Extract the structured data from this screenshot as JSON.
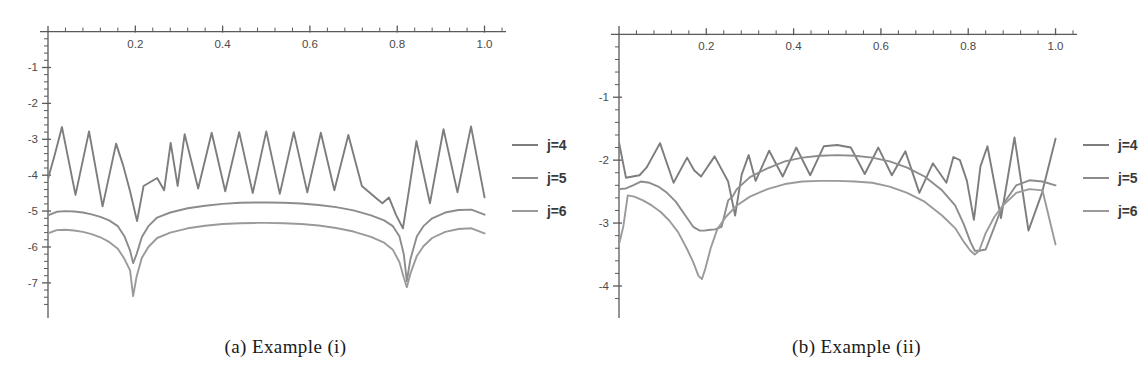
{
  "figure": {
    "panels": [
      {
        "id": "a",
        "caption": "(a) Example (i)",
        "legend": [
          {
            "label": "j=4",
            "color": "#7d7d7d"
          },
          {
            "label": "j=5",
            "color": "#8c8c8c"
          },
          {
            "label": "j=6",
            "color": "#9a9a9a"
          }
        ]
      },
      {
        "id": "b",
        "caption": "(b) Example (ii)",
        "legend": [
          {
            "label": "j=4",
            "color": "#7d7d7d"
          },
          {
            "label": "j=5",
            "color": "#8c8c8c"
          },
          {
            "label": "j=6",
            "color": "#9a9a9a"
          }
        ]
      }
    ]
  },
  "chart_data": [
    {
      "type": "line",
      "title": "(a) Example (i)",
      "xlabel": "",
      "ylabel": "",
      "xlim": [
        0,
        1.04
      ],
      "ylim": [
        -7.7,
        0.1
      ],
      "xticks": [
        0.2,
        0.4,
        0.6,
        0.8,
        1.0
      ],
      "xtick_labels": [
        "0.2",
        "0.4",
        "0.6",
        "0.8",
        "1.0"
      ],
      "yticks": [
        -1,
        -2,
        -3,
        -4,
        -5,
        -6,
        -7
      ],
      "ytick_labels": [
        "-1",
        "-2",
        "-3",
        "-4",
        "-5",
        "-6",
        "-7"
      ],
      "minor_tick_count": 4,
      "grid": false,
      "legend_position": "right",
      "series": [
        {
          "name": "j=4",
          "color": "#7d7d7d",
          "x": [
            0.0,
            0.015,
            0.032,
            0.063,
            0.094,
            0.125,
            0.156,
            0.172,
            0.188,
            0.204,
            0.219,
            0.25,
            0.266,
            0.281,
            0.297,
            0.313,
            0.344,
            0.375,
            0.406,
            0.438,
            0.469,
            0.5,
            0.531,
            0.563,
            0.594,
            0.625,
            0.656,
            0.688,
            0.719,
            0.75,
            0.766,
            0.781,
            0.797,
            0.813,
            0.828,
            0.844,
            0.875,
            0.906,
            0.938,
            0.969,
            1.0
          ],
          "y": [
            -4.1,
            -3.45,
            -2.66,
            -4.55,
            -2.78,
            -4.87,
            -3.12,
            -3.72,
            -4.45,
            -5.28,
            -4.3,
            -4.08,
            -4.42,
            -3.1,
            -4.3,
            -2.86,
            -4.37,
            -2.82,
            -4.45,
            -2.8,
            -4.5,
            -2.78,
            -4.52,
            -2.8,
            -4.48,
            -2.82,
            -4.42,
            -2.88,
            -4.3,
            -4.62,
            -4.78,
            -4.62,
            -5.1,
            -5.48,
            -4.33,
            -3.05,
            -4.78,
            -2.72,
            -4.48,
            -2.64,
            -4.62
          ]
        },
        {
          "name": "j=5",
          "color": "#8c8c8c",
          "x": [
            0.0,
            0.02,
            0.04,
            0.06,
            0.08,
            0.1,
            0.12,
            0.14,
            0.16,
            0.175,
            0.188,
            0.195,
            0.203,
            0.215,
            0.23,
            0.25,
            0.28,
            0.32,
            0.36,
            0.4,
            0.44,
            0.48,
            0.5,
            0.54,
            0.58,
            0.62,
            0.66,
            0.7,
            0.74,
            0.77,
            0.79,
            0.805,
            0.815,
            0.822,
            0.83,
            0.845,
            0.86,
            0.88,
            0.91,
            0.94,
            0.97,
            1.0
          ],
          "y": [
            -5.12,
            -5.02,
            -5.0,
            -5.01,
            -5.04,
            -5.09,
            -5.16,
            -5.26,
            -5.42,
            -5.7,
            -6.1,
            -6.45,
            -6.2,
            -5.72,
            -5.42,
            -5.18,
            -5.04,
            -4.92,
            -4.85,
            -4.8,
            -4.77,
            -4.76,
            -4.76,
            -4.77,
            -4.79,
            -4.83,
            -4.89,
            -4.98,
            -5.12,
            -5.26,
            -5.42,
            -5.7,
            -6.2,
            -6.95,
            -6.35,
            -5.7,
            -5.42,
            -5.2,
            -5.04,
            -4.97,
            -4.96,
            -5.1
          ]
        },
        {
          "name": "j=6",
          "color": "#9a9a9a",
          "x": [
            0.0,
            0.02,
            0.04,
            0.06,
            0.08,
            0.1,
            0.12,
            0.14,
            0.16,
            0.175,
            0.188,
            0.195,
            0.203,
            0.215,
            0.23,
            0.25,
            0.28,
            0.32,
            0.36,
            0.4,
            0.44,
            0.48,
            0.5,
            0.54,
            0.58,
            0.62,
            0.66,
            0.7,
            0.74,
            0.77,
            0.79,
            0.805,
            0.815,
            0.822,
            0.83,
            0.845,
            0.86,
            0.88,
            0.91,
            0.94,
            0.97,
            1.0
          ],
          "y": [
            -5.62,
            -5.53,
            -5.52,
            -5.54,
            -5.58,
            -5.64,
            -5.73,
            -5.86,
            -6.05,
            -6.33,
            -6.65,
            -7.37,
            -6.82,
            -6.3,
            -6.0,
            -5.75,
            -5.6,
            -5.48,
            -5.41,
            -5.36,
            -5.34,
            -5.33,
            -5.33,
            -5.34,
            -5.36,
            -5.4,
            -5.47,
            -5.57,
            -5.72,
            -5.88,
            -6.08,
            -6.42,
            -6.85,
            -7.12,
            -6.75,
            -6.25,
            -5.98,
            -5.75,
            -5.58,
            -5.5,
            -5.48,
            -5.62
          ]
        }
      ]
    },
    {
      "type": "line",
      "title": "(b) Example (ii)",
      "xlabel": "",
      "ylabel": "",
      "xlim": [
        0,
        1.04
      ],
      "ylim": [
        -4.35,
        0.1
      ],
      "xticks": [
        0.2,
        0.4,
        0.6,
        0.8,
        1.0
      ],
      "xtick_labels": [
        "0.2",
        "0.4",
        "0.6",
        "0.8",
        "1.0"
      ],
      "yticks": [
        -1,
        -2,
        -3,
        -4
      ],
      "ytick_labels": [
        "-1",
        "-2",
        "-3",
        "-4"
      ],
      "minor_tick_count": 4,
      "grid": false,
      "legend_position": "right",
      "series": [
        {
          "name": "j=4",
          "color": "#7d7d7d",
          "x": [
            0.0,
            0.016,
            0.031,
            0.047,
            0.063,
            0.094,
            0.125,
            0.156,
            0.172,
            0.188,
            0.219,
            0.25,
            0.266,
            0.281,
            0.297,
            0.313,
            0.344,
            0.375,
            0.406,
            0.438,
            0.469,
            0.5,
            0.531,
            0.563,
            0.594,
            0.625,
            0.656,
            0.688,
            0.719,
            0.75,
            0.766,
            0.781,
            0.797,
            0.813,
            0.828,
            0.844,
            0.875,
            0.906,
            0.938,
            0.969,
            1.0
          ],
          "y": [
            -1.72,
            -2.28,
            -2.26,
            -2.24,
            -2.12,
            -1.73,
            -2.36,
            -1.96,
            -2.16,
            -2.26,
            -1.94,
            -2.34,
            -2.88,
            -2.23,
            -1.92,
            -2.33,
            -1.85,
            -2.26,
            -1.8,
            -2.24,
            -1.78,
            -1.76,
            -1.8,
            -2.22,
            -1.8,
            -2.24,
            -1.86,
            -2.52,
            -2.05,
            -2.36,
            -1.95,
            -2.0,
            -2.33,
            -2.95,
            -2.1,
            -1.78,
            -2.92,
            -1.64,
            -3.12,
            -2.52,
            -1.66
          ]
        },
        {
          "name": "j=5",
          "color": "#8c8c8c",
          "x": [
            0.0,
            0.016,
            0.032,
            0.05,
            0.07,
            0.09,
            0.11,
            0.13,
            0.15,
            0.17,
            0.185,
            0.195,
            0.205,
            0.22,
            0.235,
            0.25,
            0.26,
            0.27,
            0.3,
            0.34,
            0.38,
            0.42,
            0.46,
            0.5,
            0.54,
            0.58,
            0.62,
            0.66,
            0.7,
            0.74,
            0.77,
            0.79,
            0.805,
            0.815,
            0.825,
            0.84,
            0.86,
            0.88,
            0.91,
            0.94,
            0.97,
            1.0
          ],
          "y": [
            -2.46,
            -2.45,
            -2.4,
            -2.34,
            -2.36,
            -2.42,
            -2.52,
            -2.66,
            -2.86,
            -3.06,
            -3.12,
            -3.12,
            -3.11,
            -3.1,
            -3.06,
            -2.64,
            -2.58,
            -2.46,
            -2.27,
            -2.13,
            -2.02,
            -1.96,
            -1.93,
            -1.92,
            -1.93,
            -1.96,
            -2.02,
            -2.12,
            -2.26,
            -2.48,
            -2.72,
            -3.02,
            -3.3,
            -3.44,
            -3.44,
            -3.42,
            -3.06,
            -2.7,
            -2.4,
            -2.32,
            -2.34,
            -2.4
          ]
        },
        {
          "name": "j=6",
          "color": "#9a9a9a",
          "x": [
            0.0,
            0.01,
            0.02,
            0.035,
            0.055,
            0.075,
            0.095,
            0.115,
            0.135,
            0.155,
            0.17,
            0.182,
            0.19,
            0.198,
            0.21,
            0.225,
            0.245,
            0.27,
            0.3,
            0.34,
            0.38,
            0.42,
            0.46,
            0.5,
            0.54,
            0.58,
            0.62,
            0.66,
            0.7,
            0.74,
            0.77,
            0.79,
            0.805,
            0.815,
            0.825,
            0.84,
            0.86,
            0.88,
            0.91,
            0.94,
            0.97,
            1.0
          ],
          "y": [
            -3.34,
            -3.05,
            -2.56,
            -2.58,
            -2.64,
            -2.72,
            -2.82,
            -2.96,
            -3.14,
            -3.4,
            -3.62,
            -3.84,
            -3.89,
            -3.72,
            -3.4,
            -3.1,
            -2.9,
            -2.72,
            -2.58,
            -2.46,
            -2.38,
            -2.34,
            -2.33,
            -2.33,
            -2.34,
            -2.36,
            -2.42,
            -2.52,
            -2.66,
            -2.88,
            -3.08,
            -3.3,
            -3.44,
            -3.5,
            -3.44,
            -3.16,
            -2.9,
            -2.72,
            -2.52,
            -2.46,
            -2.48,
            -3.34
          ]
        }
      ]
    }
  ]
}
